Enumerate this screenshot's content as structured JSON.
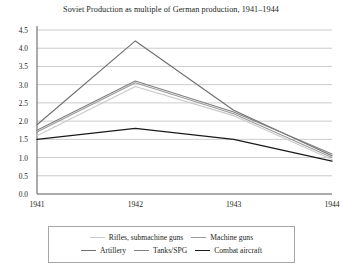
{
  "chart_data": {
    "type": "line",
    "title": "Soviet Production as multiple of German production, 1941–1944",
    "xlabel": "",
    "ylabel": "",
    "categories": [
      "1941",
      "1942",
      "1943",
      "1944"
    ],
    "ylim": [
      0.0,
      4.5
    ],
    "ytick_labels": [
      "0.0",
      "0.5",
      "1.0",
      "1.5",
      "2.0",
      "2.5",
      "3.0",
      "3.5",
      "4.0",
      "4.5"
    ],
    "ytick_values": [
      0.0,
      0.5,
      1.0,
      1.5,
      2.0,
      2.5,
      3.0,
      3.5,
      4.0,
      4.5
    ],
    "grid": true,
    "legend_position": "bottom",
    "series": [
      {
        "name": "Rifles, submachine guns",
        "color": "#c9c9c9",
        "values": [
          1.6,
          2.95,
          2.15,
          0.95
        ]
      },
      {
        "name": "Machine guns",
        "color": "#9b9b9b",
        "values": [
          1.7,
          3.05,
          2.2,
          1.0
        ]
      },
      {
        "name": "Artillery",
        "color": "#6e6e6e",
        "values": [
          1.9,
          4.2,
          2.3,
          1.05
        ]
      },
      {
        "name": "Tanks/SPG",
        "color": "#808080",
        "values": [
          1.75,
          3.1,
          2.25,
          1.1
        ]
      },
      {
        "name": "Combat aircraft",
        "color": "#1a1a1a",
        "values": [
          1.5,
          1.8,
          1.5,
          0.9
        ]
      }
    ]
  },
  "axis": {
    "gridline_color": "#bfbfbf",
    "axis_color": "#595959"
  },
  "legend": {
    "border_color": "#a6a6a6",
    "rows": [
      [
        {
          "label": "Rifles, submachine guns",
          "series_index": 0
        },
        {
          "label": "Machine guns",
          "series_index": 1
        }
      ],
      [
        {
          "label": "Artillery",
          "series_index": 2
        },
        {
          "label": "Tanks/SPG",
          "series_index": 3
        },
        {
          "label": "Combat aircraft",
          "series_index": 4
        }
      ]
    ]
  }
}
